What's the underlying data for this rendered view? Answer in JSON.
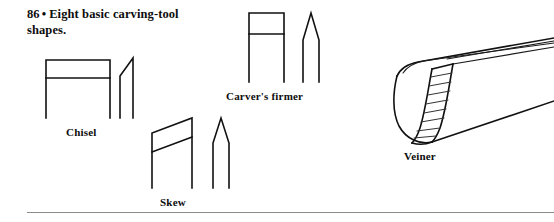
{
  "page": {
    "background_color": "#ffffff",
    "ink_color": "#111111",
    "rule_color": "#8a8a8a",
    "width": 554,
    "height": 222
  },
  "caption": {
    "figure_number": "86",
    "bullet": "•",
    "text_line_1": "Eight basic",
    "text_line_2": "carving-tool shapes.",
    "full_text": "86 • Eight basic carving-tool shapes."
  },
  "figures": [
    {
      "id": "chisel",
      "label": "Chisel",
      "views": [
        "front elevation rectangle with single bevel line",
        "side profile with single angled bevel"
      ]
    },
    {
      "id": "carvers-firmer",
      "label": "Carver's firmer",
      "views": [
        "front elevation rectangle with bevel line",
        "side profile with symmetric double bevel point"
      ]
    },
    {
      "id": "skew",
      "label": "Skew",
      "views": [
        "front elevation with slanted skew edge and bevel line",
        "side profile with symmetric point"
      ]
    },
    {
      "id": "veiner",
      "label": "Veiner",
      "views": [
        "three-quarter perspective of U-shaped gouge with hatched bevel"
      ]
    }
  ],
  "footer": {
    "rule_visible": "true"
  }
}
